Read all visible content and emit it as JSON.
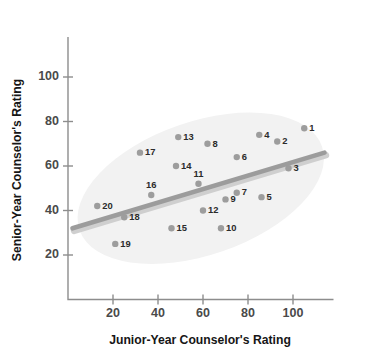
{
  "chart_data": {
    "type": "scatter",
    "title": "",
    "xlabel": "Junior-Year Counselor's Rating",
    "ylabel": "Senior-Year Counselor's Rating",
    "xlim": [
      0,
      118
    ],
    "ylim": [
      0,
      118
    ],
    "xticks": [
      20,
      40,
      60,
      80,
      100
    ],
    "yticks": [
      20,
      40,
      60,
      80,
      100
    ],
    "xtick_labels": [
      "20",
      "40",
      "60",
      "80",
      "100"
    ],
    "ytick_labels": [
      "20",
      "40",
      "60",
      "80",
      "100"
    ],
    "grid": false,
    "legend": false,
    "point_label_key": "case number",
    "points": [
      {
        "label": "1",
        "x": 105,
        "y": 77,
        "lpos": "right"
      },
      {
        "label": "2",
        "x": 93,
        "y": 71,
        "lpos": "right"
      },
      {
        "label": "3",
        "x": 98,
        "y": 59,
        "lpos": "right"
      },
      {
        "label": "4",
        "x": 85,
        "y": 74,
        "lpos": "right"
      },
      {
        "label": "5",
        "x": 86,
        "y": 46,
        "lpos": "right"
      },
      {
        "label": "6",
        "x": 75,
        "y": 64,
        "lpos": "right"
      },
      {
        "label": "7",
        "x": 75,
        "y": 48,
        "lpos": "right"
      },
      {
        "label": "8",
        "x": 62,
        "y": 70,
        "lpos": "right"
      },
      {
        "label": "9",
        "x": 70,
        "y": 45,
        "lpos": "right"
      },
      {
        "label": "10",
        "x": 68,
        "y": 32,
        "lpos": "right"
      },
      {
        "label": "11",
        "x": 58,
        "y": 52,
        "lpos": "above"
      },
      {
        "label": "12",
        "x": 60,
        "y": 40,
        "lpos": "right"
      },
      {
        "label": "13",
        "x": 49,
        "y": 73,
        "lpos": "right"
      },
      {
        "label": "14",
        "x": 48,
        "y": 60,
        "lpos": "right"
      },
      {
        "label": "15",
        "x": 46,
        "y": 32,
        "lpos": "right"
      },
      {
        "label": "16",
        "x": 37,
        "y": 47,
        "lpos": "above"
      },
      {
        "label": "17",
        "x": 32,
        "y": 66,
        "lpos": "right"
      },
      {
        "label": "18",
        "x": 25,
        "y": 37,
        "lpos": "right"
      },
      {
        "label": "19",
        "x": 21,
        "y": 25,
        "lpos": "right"
      },
      {
        "label": "20",
        "x": 13,
        "y": 42,
        "lpos": "right"
      }
    ],
    "trend_line": {
      "name": "regression line",
      "x_start": 2,
      "y_start": 32,
      "x_end": 114,
      "y_end": 66
    },
    "hull_ellipse": {
      "name": "data-concentration ellipse",
      "center_x": 59,
      "center_y": 50,
      "radius_x": 57,
      "radius_y": 30,
      "rotation_deg": -19
    },
    "colors": {
      "point": "#9d9d9d",
      "point_label": "#2b2b2b",
      "trend_line": "#9c9c9c",
      "ellipse": "#f2f2f2",
      "axis": "#8d8d8d",
      "tick_label": "#4a4a4a",
      "axis_title": "#161616",
      "background": "#ffffff"
    }
  }
}
